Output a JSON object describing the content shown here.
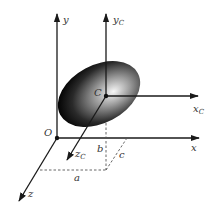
{
  "diagram": {
    "type": "3d-coordinate-frames",
    "global_frame": {
      "origin_label": "O",
      "x_label": "x",
      "y_label": "y",
      "z_label": "z"
    },
    "local_frame": {
      "origin_label": "C",
      "x_label": "x",
      "x_sub": "C",
      "y_label": "y",
      "y_sub": "C",
      "z_label": "z",
      "z_sub": "C"
    },
    "offsets": {
      "a_label": "a",
      "b_label": "b",
      "c_label": "c"
    },
    "colors": {
      "line": "#1a1a1a",
      "dashed": "#555555",
      "ellipsoid_dark": "#0a0a0a",
      "ellipsoid_light": "#f4f4f4"
    }
  }
}
